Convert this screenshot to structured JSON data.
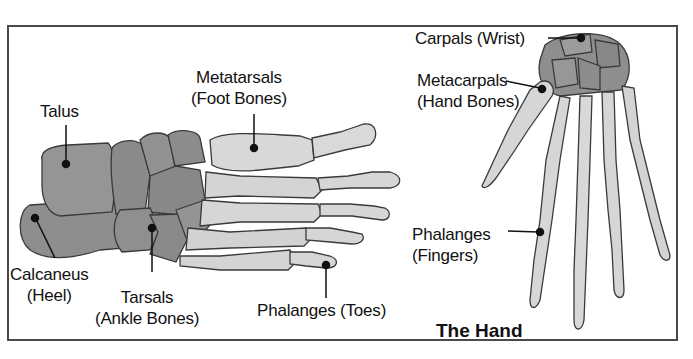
{
  "diagram": {
    "frame_color": "#4a4a4a",
    "colors": {
      "dark_bone": "#8e8e8e",
      "light_bone": "#d6d6d6",
      "outline": "#3a3a3a",
      "leader": "#111111"
    },
    "foot": {
      "labels": [
        {
          "id": "talus",
          "line1": "Talus",
          "line2": ""
        },
        {
          "id": "metatarsals",
          "line1": "Metatarsals",
          "line2": "(Foot Bones)"
        },
        {
          "id": "calcaneus",
          "line1": "Calcaneus",
          "line2": "(Heel)"
        },
        {
          "id": "tarsals",
          "line1": "Tarsals",
          "line2": "(Ankle Bones)"
        },
        {
          "id": "phalanges-toes",
          "line1": "Phalanges (Toes)",
          "line2": ""
        }
      ]
    },
    "hand": {
      "title": "The Hand",
      "labels": [
        {
          "id": "carpals",
          "line1": "Carpals (Wrist)",
          "line2": ""
        },
        {
          "id": "metacarpals",
          "line1": "Metacarpals",
          "line2": "(Hand Bones)"
        },
        {
          "id": "phalanges-fingers",
          "line1": "Phalanges",
          "line2": "(Fingers)"
        }
      ]
    }
  }
}
